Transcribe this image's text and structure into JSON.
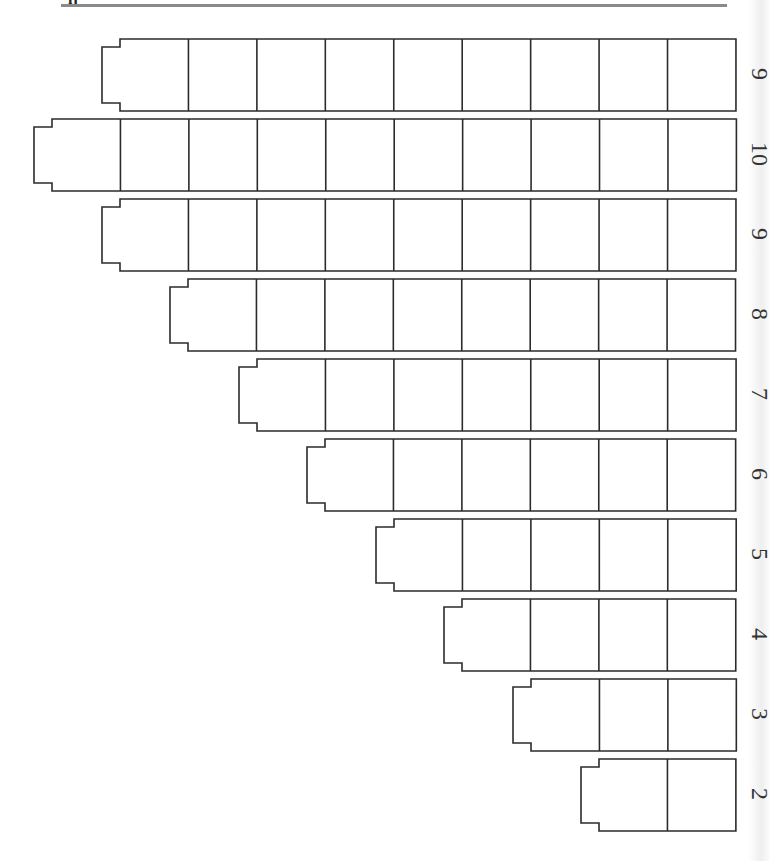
{
  "page": {
    "kind": "worksheet"
  },
  "layout": {
    "grid_right_x": 736,
    "top_y": 38,
    "row_pitch": 80,
    "row_height": 72,
    "cell_width": 68.44,
    "notch_depth_x": 18,
    "notch_inset_y": 8
  },
  "colors": {
    "stroke": "#2b2b2b",
    "label": "#333333",
    "header_rule": "#8a8a8a",
    "background": "#ffffff"
  },
  "rows": [
    {
      "label": "9",
      "cells": 9
    },
    {
      "label": "10",
      "cells": 10
    },
    {
      "label": "9",
      "cells": 9
    },
    {
      "label": "8",
      "cells": 8
    },
    {
      "label": "7",
      "cells": 7
    },
    {
      "label": "6",
      "cells": 6
    },
    {
      "label": "5",
      "cells": 5
    },
    {
      "label": "4",
      "cells": 4
    },
    {
      "label": "3",
      "cells": 3
    },
    {
      "label": "2",
      "cells": 2
    }
  ]
}
